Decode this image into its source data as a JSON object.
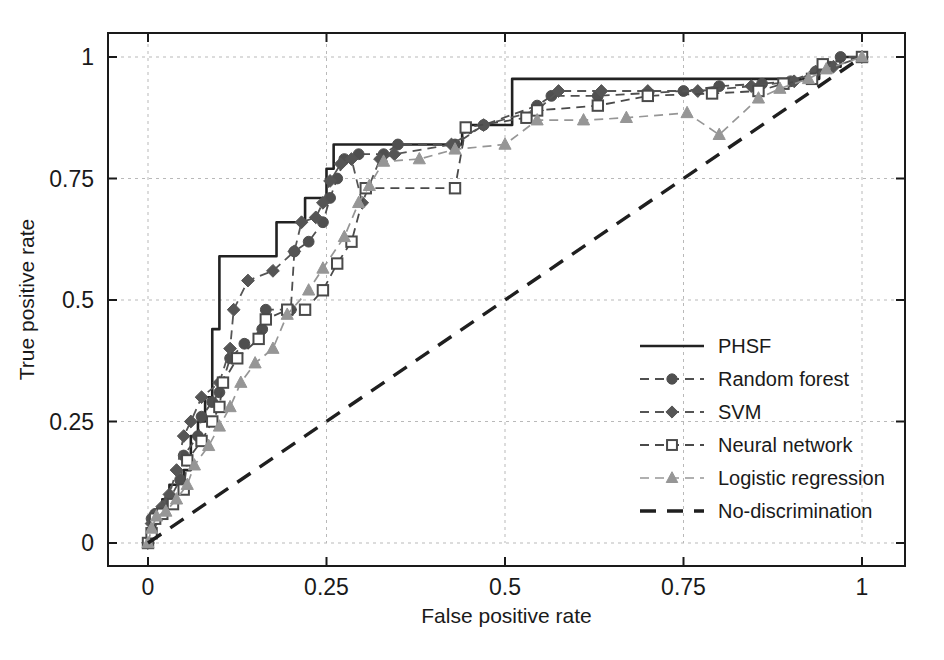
{
  "chart_data": {
    "type": "line",
    "title": "",
    "xlabel": "False positive rate",
    "ylabel": "True positive rate",
    "xlim": [
      0,
      1
    ],
    "ylim": [
      0,
      1
    ],
    "xticks": [
      "0",
      "0.25",
      "0.5",
      "0.75",
      "1"
    ],
    "xtick_values": [
      0,
      0.25,
      0.5,
      0.75,
      1
    ],
    "yticks": [
      "0",
      "0.25",
      "0.5",
      "0.75",
      "1"
    ],
    "ytick_values": [
      0,
      0.25,
      0.5,
      0.75,
      1
    ],
    "grid": true,
    "legend_position": "center-right",
    "series": [
      {
        "name": "PHSF",
        "style": "solid",
        "marker": "none",
        "color": "#222222",
        "linewidth": 2.6,
        "step": true,
        "points": [
          [
            0.0,
            0.0
          ],
          [
            0.0,
            0.03
          ],
          [
            0.01,
            0.03
          ],
          [
            0.01,
            0.06
          ],
          [
            0.02,
            0.06
          ],
          [
            0.02,
            0.09
          ],
          [
            0.03,
            0.09
          ],
          [
            0.03,
            0.12
          ],
          [
            0.04,
            0.12
          ],
          [
            0.05,
            0.15
          ],
          [
            0.06,
            0.18
          ],
          [
            0.06,
            0.22
          ],
          [
            0.07,
            0.25
          ],
          [
            0.08,
            0.3
          ],
          [
            0.09,
            0.36
          ],
          [
            0.09,
            0.44
          ],
          [
            0.1,
            0.59
          ],
          [
            0.17,
            0.59
          ],
          [
            0.18,
            0.66
          ],
          [
            0.21,
            0.66
          ],
          [
            0.22,
            0.71
          ],
          [
            0.24,
            0.71
          ],
          [
            0.25,
            0.77
          ],
          [
            0.26,
            0.82
          ],
          [
            0.43,
            0.82
          ],
          [
            0.44,
            0.86
          ],
          [
            0.5,
            0.86
          ],
          [
            0.51,
            0.955
          ],
          [
            0.93,
            0.955
          ],
          [
            0.94,
            0.98
          ],
          [
            0.96,
            0.98
          ],
          [
            0.97,
            1.0
          ],
          [
            1.0,
            1.0
          ]
        ]
      },
      {
        "name": "Random forest",
        "style": "dashed",
        "marker": "circle",
        "color": "#4f4f4f",
        "linewidth": 1.8,
        "step": false,
        "points": [
          [
            0.0,
            0.0
          ],
          [
            0.005,
            0.05
          ],
          [
            0.01,
            0.06
          ],
          [
            0.02,
            0.07
          ],
          [
            0.03,
            0.09
          ],
          [
            0.045,
            0.13
          ],
          [
            0.05,
            0.18
          ],
          [
            0.07,
            0.22
          ],
          [
            0.075,
            0.26
          ],
          [
            0.09,
            0.29
          ],
          [
            0.1,
            0.31
          ],
          [
            0.115,
            0.38
          ],
          [
            0.135,
            0.41
          ],
          [
            0.16,
            0.44
          ],
          [
            0.165,
            0.48
          ],
          [
            0.2,
            0.48
          ],
          [
            0.205,
            0.6
          ],
          [
            0.225,
            0.62
          ],
          [
            0.245,
            0.66
          ],
          [
            0.255,
            0.71
          ],
          [
            0.265,
            0.75
          ],
          [
            0.275,
            0.79
          ],
          [
            0.295,
            0.8
          ],
          [
            0.33,
            0.8
          ],
          [
            0.35,
            0.82
          ],
          [
            0.43,
            0.82
          ],
          [
            0.47,
            0.86
          ],
          [
            0.545,
            0.9
          ],
          [
            0.565,
            0.92
          ],
          [
            0.63,
            0.92
          ],
          [
            0.75,
            0.93
          ],
          [
            0.8,
            0.94
          ],
          [
            0.86,
            0.945
          ],
          [
            0.9,
            0.95
          ],
          [
            0.935,
            0.97
          ],
          [
            0.955,
            0.98
          ],
          [
            0.97,
            1.0
          ],
          [
            1.0,
            1.0
          ]
        ]
      },
      {
        "name": "SVM",
        "style": "dashed",
        "marker": "diamond",
        "color": "#555555",
        "linewidth": 1.8,
        "step": false,
        "points": [
          [
            0.0,
            0.0
          ],
          [
            0.005,
            0.04
          ],
          [
            0.012,
            0.06
          ],
          [
            0.02,
            0.075
          ],
          [
            0.03,
            0.1
          ],
          [
            0.04,
            0.15
          ],
          [
            0.05,
            0.22
          ],
          [
            0.06,
            0.25
          ],
          [
            0.075,
            0.3
          ],
          [
            0.1,
            0.33
          ],
          [
            0.115,
            0.4
          ],
          [
            0.12,
            0.48
          ],
          [
            0.14,
            0.54
          ],
          [
            0.175,
            0.56
          ],
          [
            0.205,
            0.6
          ],
          [
            0.215,
            0.66
          ],
          [
            0.235,
            0.67
          ],
          [
            0.245,
            0.7
          ],
          [
            0.255,
            0.745
          ],
          [
            0.27,
            0.78
          ],
          [
            0.285,
            0.79
          ],
          [
            0.3,
            0.7
          ],
          [
            0.325,
            0.79
          ],
          [
            0.345,
            0.8
          ],
          [
            0.425,
            0.82
          ],
          [
            0.47,
            0.86
          ],
          [
            0.545,
            0.89
          ],
          [
            0.575,
            0.93
          ],
          [
            0.635,
            0.93
          ],
          [
            0.7,
            0.93
          ],
          [
            0.77,
            0.93
          ],
          [
            0.845,
            0.94
          ],
          [
            0.905,
            0.95
          ],
          [
            0.935,
            0.97
          ],
          [
            0.96,
            0.98
          ],
          [
            1.0,
            1.0
          ]
        ]
      },
      {
        "name": "Neural network",
        "style": "dashed",
        "marker": "square-open",
        "color": "#4a4a4a",
        "linewidth": 1.8,
        "step": false,
        "points": [
          [
            0.0,
            0.0
          ],
          [
            0.005,
            0.02
          ],
          [
            0.01,
            0.05
          ],
          [
            0.02,
            0.06
          ],
          [
            0.035,
            0.08
          ],
          [
            0.05,
            0.11
          ],
          [
            0.055,
            0.17
          ],
          [
            0.075,
            0.21
          ],
          [
            0.09,
            0.25
          ],
          [
            0.1,
            0.28
          ],
          [
            0.105,
            0.33
          ],
          [
            0.125,
            0.38
          ],
          [
            0.155,
            0.42
          ],
          [
            0.165,
            0.46
          ],
          [
            0.195,
            0.48
          ],
          [
            0.22,
            0.48
          ],
          [
            0.245,
            0.52
          ],
          [
            0.265,
            0.575
          ],
          [
            0.285,
            0.62
          ],
          [
            0.305,
            0.73
          ],
          [
            0.43,
            0.73
          ],
          [
            0.445,
            0.855
          ],
          [
            0.53,
            0.875
          ],
          [
            0.545,
            0.89
          ],
          [
            0.63,
            0.9
          ],
          [
            0.7,
            0.92
          ],
          [
            0.79,
            0.925
          ],
          [
            0.855,
            0.93
          ],
          [
            0.89,
            0.945
          ],
          [
            0.93,
            0.955
          ],
          [
            0.945,
            0.985
          ],
          [
            1.0,
            1.0
          ]
        ]
      },
      {
        "name": "Logistic regression",
        "style": "dashed",
        "marker": "triangle",
        "color": "#969696",
        "linewidth": 1.7,
        "step": false,
        "points": [
          [
            0.0,
            0.0
          ],
          [
            0.005,
            0.03
          ],
          [
            0.012,
            0.055
          ],
          [
            0.025,
            0.065
          ],
          [
            0.04,
            0.09
          ],
          [
            0.055,
            0.12
          ],
          [
            0.065,
            0.16
          ],
          [
            0.085,
            0.2
          ],
          [
            0.1,
            0.24
          ],
          [
            0.115,
            0.28
          ],
          [
            0.13,
            0.33
          ],
          [
            0.15,
            0.37
          ],
          [
            0.175,
            0.4
          ],
          [
            0.195,
            0.47
          ],
          [
            0.225,
            0.52
          ],
          [
            0.245,
            0.565
          ],
          [
            0.275,
            0.63
          ],
          [
            0.295,
            0.7
          ],
          [
            0.31,
            0.735
          ],
          [
            0.33,
            0.785
          ],
          [
            0.38,
            0.79
          ],
          [
            0.43,
            0.81
          ],
          [
            0.5,
            0.82
          ],
          [
            0.545,
            0.87
          ],
          [
            0.61,
            0.87
          ],
          [
            0.67,
            0.875
          ],
          [
            0.755,
            0.885
          ],
          [
            0.8,
            0.84
          ],
          [
            0.855,
            0.915
          ],
          [
            0.885,
            0.935
          ],
          [
            0.925,
            0.955
          ],
          [
            0.95,
            0.975
          ],
          [
            1.0,
            1.0
          ]
        ]
      },
      {
        "name": "No-discrimination",
        "style": "dashed-long",
        "marker": "none",
        "color": "#1f1f1f",
        "linewidth": 3.4,
        "step": false,
        "points": [
          [
            0.0,
            0.0
          ],
          [
            1.0,
            1.0
          ]
        ]
      }
    ]
  },
  "legend": {
    "entries": [
      {
        "label": "PHSF",
        "marker": "none",
        "style": "solid"
      },
      {
        "label": "Random forest",
        "marker": "circle",
        "style": "dashed"
      },
      {
        "label": "SVM",
        "marker": "diamond",
        "style": "dashed"
      },
      {
        "label": "Neural network",
        "marker": "square-open",
        "style": "dashed"
      },
      {
        "label": "Logistic regression",
        "marker": "triangle",
        "style": "dashed"
      },
      {
        "label": "No-discrimination",
        "marker": "none",
        "style": "dashed-long"
      }
    ]
  },
  "colors": {
    "axis": "#1a1a1a",
    "grid": "#b9b9b9",
    "background": "#ffffff",
    "phsf": "#222222",
    "random_forest": "#4f4f4f",
    "svm": "#555555",
    "neural_network": "#4a4a4a",
    "logistic_regression": "#969696",
    "no_discrimination": "#1f1f1f"
  },
  "caption": {
    "text": ""
  }
}
